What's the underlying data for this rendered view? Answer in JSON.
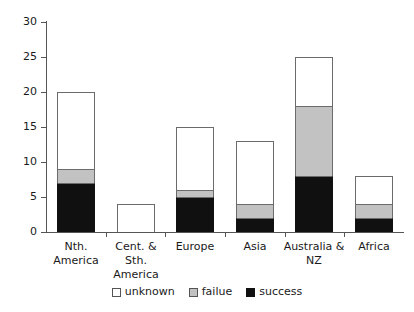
{
  "chart_data": {
    "type": "bar",
    "subtype": "stacked-vertical",
    "title": "",
    "xlabel": "",
    "ylabel": "",
    "ylim": [
      0,
      30
    ],
    "yticks": [
      0,
      5,
      10,
      15,
      20,
      25,
      30
    ],
    "grid": false,
    "legend_position": "bottom-center",
    "categories": [
      "Nth. America",
      "Cent. & Sth. America",
      "Europe",
      "Asia",
      "Australia & NZ",
      "Africa"
    ],
    "category_lines": [
      [
        "Nth.",
        "America"
      ],
      [
        "Cent. &",
        "Sth.",
        "America"
      ],
      [
        "Europe"
      ],
      [
        "Asia"
      ],
      [
        "Australia &",
        "NZ"
      ],
      [
        "Africa"
      ]
    ],
    "series": [
      {
        "name": "success",
        "color": "#101010",
        "values": [
          7,
          0,
          5,
          2,
          8,
          2
        ]
      },
      {
        "name": "failue",
        "color": "#c2c2c2",
        "values": [
          2,
          0,
          1,
          2,
          10,
          2
        ]
      },
      {
        "name": "unknown",
        "color": "#ffffff",
        "values": [
          11,
          4,
          9,
          9,
          7,
          4
        ]
      }
    ],
    "totals": [
      20,
      4,
      15,
      13,
      25,
      8
    ],
    "stack_order_bottom_to_top": [
      "success",
      "failue",
      "unknown"
    ]
  },
  "legend": {
    "items": [
      {
        "label": "unknown",
        "swatch": "white-square"
      },
      {
        "label": "failue",
        "swatch": "gray-square"
      },
      {
        "label": "success",
        "swatch": "black-square"
      }
    ]
  },
  "axis": {
    "y_tick_labels": [
      "0",
      "5",
      "10",
      "15",
      "20",
      "25",
      "30"
    ]
  }
}
